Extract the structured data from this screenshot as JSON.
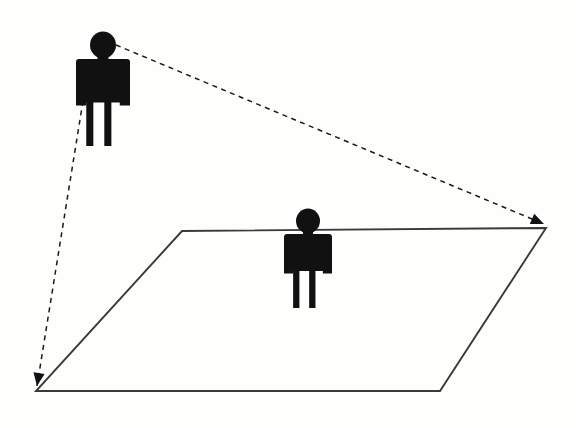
{
  "diagram": {
    "background_color": "#fefefd",
    "width": 576,
    "height": 428,
    "line_color": "#3a3a3a",
    "dashed_line_color": "#1a1a1a",
    "figure_color": "#111111",
    "plane": {
      "name": "ground-plane",
      "shape": "parallelogram",
      "stroke_width": 1.9,
      "vertices": [
        {
          "label": "top-left",
          "x": 182,
          "y": 231
        },
        {
          "label": "top-right",
          "x": 546,
          "y": 228
        },
        {
          "label": "bottom-right",
          "x": 440,
          "y": 391
        },
        {
          "label": "bottom-left",
          "x": 36,
          "y": 391
        }
      ]
    },
    "figures": [
      {
        "name": "standing-observer-figure",
        "position_label": "upper-left",
        "head_center_x": 103,
        "head_center_y": 45,
        "head_radius": 13,
        "body_top_y": 59,
        "body_bottom_y": 146,
        "body_half_width": 27,
        "scale": 1.0
      },
      {
        "name": "projected-figure-on-plane",
        "position_label": "center",
        "head_center_x": 308,
        "head_center_y": 221,
        "head_radius": 12,
        "body_top_y": 234,
        "body_bottom_y": 308,
        "body_half_width": 24,
        "scale": 0.86
      }
    ],
    "sight_lines": [
      {
        "name": "upper-sight-line",
        "from_x": 116,
        "from_y": 45,
        "to_x": 544,
        "to_y": 224,
        "style": "dashed",
        "arrowhead": "at-end",
        "arrow_direction_degrees": 23
      },
      {
        "name": "lower-sight-line",
        "from_x": 83,
        "from_y": 101,
        "to_x": 37,
        "to_y": 386,
        "style": "dashed",
        "arrowhead": "at-end",
        "arrow_direction_degrees": 99
      }
    ],
    "arrowheads": [
      {
        "name": "right-vertex-arrowhead",
        "x": 544,
        "y": 224,
        "angle": 23
      },
      {
        "name": "left-vertex-arrowhead",
        "x": 37,
        "y": 386,
        "angle": 99
      }
    ]
  },
  "caption": {
    "alt_text": "Line drawing: a black pictogram person stands at upper left; two dashed lines with arrowheads run from the person's head and hand to the far and near corners of a parallelogram ground plane; a second, smaller pictogram person stands in the middle of the plane."
  }
}
